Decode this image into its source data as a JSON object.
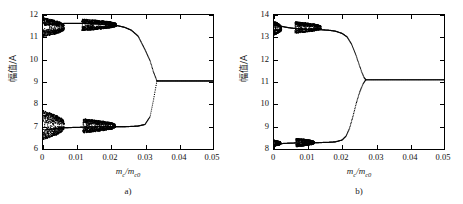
{
  "figure": {
    "panels": [
      {
        "id": "a",
        "caption": "a)",
        "xaxis_label_main": "m",
        "xaxis_label_sub1": "c",
        "xaxis_label_mid": "/m",
        "xaxis_label_sub2": "c0",
        "yaxis_label": "幅值/A",
        "xticks": [
          "0",
          "0.01",
          "0.02",
          "0.03",
          "0.04",
          "0.05"
        ],
        "yticks": [
          "6",
          "7",
          "8",
          "9",
          "10",
          "11",
          "12"
        ]
      },
      {
        "id": "b",
        "caption": "b)",
        "xaxis_label_main": "m",
        "xaxis_label_sub1": "c",
        "xaxis_label_mid": "/m",
        "xaxis_label_sub2": "c0",
        "yaxis_label": "幅值/A",
        "xticks": [
          "0",
          "0.01",
          "0.02",
          "0.03",
          "0.04",
          "0.05"
        ],
        "yticks": [
          "8",
          "9",
          "10",
          "11",
          "12",
          "13",
          "14"
        ]
      }
    ]
  },
  "chart_data": [
    {
      "type": "scatter",
      "panel": "a",
      "title": "",
      "xlabel": "m_c/m_c0",
      "ylabel": "幅值/A",
      "xlim": [
        0,
        0.05
      ],
      "ylim": [
        6,
        12
      ],
      "xticks": [
        0,
        0.01,
        0.02,
        0.03,
        0.04,
        0.05
      ],
      "yticks": [
        6,
        7,
        8,
        9,
        10,
        11,
        12
      ],
      "grid": false,
      "legend": "none",
      "description": "Bifurcation diagram: chaotic/period-doubled bands at low m_c/m_c0 collapsing to a single branch near m_c/m_c0 = 0.033 at amplitude 9.05",
      "branches": [
        {
          "name": "upper-branch",
          "x": [
            0.0005,
            0.002,
            0.004,
            0.006,
            0.008,
            0.01,
            0.012,
            0.014,
            0.016,
            0.018,
            0.02,
            0.022,
            0.024,
            0.026,
            0.028,
            0.03,
            0.0315,
            0.0325,
            0.0335
          ],
          "y": [
            11.55,
            11.58,
            11.6,
            11.62,
            11.62,
            11.62,
            11.63,
            11.62,
            11.6,
            11.58,
            11.56,
            11.52,
            11.45,
            11.32,
            11.05,
            10.45,
            9.95,
            9.45,
            9.05
          ]
        },
        {
          "name": "lower-branch",
          "x": [
            0.0005,
            0.002,
            0.004,
            0.006,
            0.008,
            0.01,
            0.012,
            0.014,
            0.016,
            0.018,
            0.02,
            0.022,
            0.024,
            0.026,
            0.028,
            0.03,
            0.0315,
            0.0325,
            0.0335
          ],
          "y": [
            6.85,
            6.88,
            6.92,
            6.95,
            6.96,
            6.97,
            6.98,
            6.99,
            7.0,
            7.0,
            7.0,
            7.0,
            7.0,
            7.01,
            7.03,
            7.1,
            7.45,
            8.2,
            9.05
          ]
        },
        {
          "name": "merged-branch",
          "x": [
            0.0335,
            0.036,
            0.04,
            0.044,
            0.048,
            0.05
          ],
          "y": [
            9.05,
            9.05,
            9.05,
            9.05,
            9.05,
            9.05
          ]
        }
      ],
      "chaotic_bands": [
        {
          "name": "upper-band-1",
          "x_range": [
            0.0,
            0.0062
          ],
          "y_range": [
            11.02,
            11.88
          ]
        },
        {
          "name": "upper-band-2",
          "x_range": [
            0.0115,
            0.0215
          ],
          "y_range": [
            11.3,
            11.82
          ]
        },
        {
          "name": "lower-band-1",
          "x_range": [
            0.0,
            0.0062
          ],
          "y_range": [
            6.42,
            7.72
          ]
        },
        {
          "name": "lower-band-2",
          "x_range": [
            0.0118,
            0.0212
          ],
          "y_range": [
            6.72,
            7.35
          ]
        }
      ]
    },
    {
      "type": "scatter",
      "panel": "b",
      "title": "",
      "xlabel": "m_c/m_c0",
      "ylabel": "幅值/A",
      "xlim": [
        0,
        0.05
      ],
      "ylim": [
        8,
        14
      ],
      "xticks": [
        0,
        0.01,
        0.02,
        0.03,
        0.04,
        0.05
      ],
      "yticks": [
        8,
        9,
        10,
        11,
        12,
        13,
        14
      ],
      "grid": false,
      "legend": "none",
      "description": "Bifurcation diagram: period-doubled bands at low m_c/m_c0 with a steep near-vertical transition merging to a single branch near m_c/m_c0 = 0.027 at amplitude 11.1",
      "branches": [
        {
          "name": "upper-branch",
          "x": [
            0.0005,
            0.002,
            0.004,
            0.006,
            0.008,
            0.01,
            0.012,
            0.014,
            0.016,
            0.018,
            0.02,
            0.0215,
            0.0228,
            0.024,
            0.025,
            0.0258,
            0.0265,
            0.027
          ],
          "y": [
            13.58,
            13.5,
            13.44,
            13.4,
            13.38,
            13.36,
            13.35,
            13.34,
            13.32,
            13.28,
            13.18,
            13.02,
            12.7,
            12.25,
            11.8,
            11.45,
            11.2,
            11.1
          ]
        },
        {
          "name": "lower-branch",
          "x": [
            0.0005,
            0.002,
            0.004,
            0.006,
            0.008,
            0.01,
            0.012,
            0.014,
            0.016,
            0.018,
            0.02,
            0.0212,
            0.0222,
            0.0232,
            0.0242,
            0.0252,
            0.0262,
            0.027
          ],
          "y": [
            8.22,
            8.24,
            8.26,
            8.27,
            8.28,
            8.28,
            8.28,
            8.29,
            8.3,
            8.32,
            8.4,
            8.58,
            8.92,
            9.45,
            10.05,
            10.55,
            10.92,
            11.1
          ]
        },
        {
          "name": "merged-branch",
          "x": [
            0.027,
            0.03,
            0.035,
            0.04,
            0.045,
            0.05
          ],
          "y": [
            11.1,
            11.1,
            11.1,
            11.1,
            11.1,
            11.1
          ]
        }
      ],
      "chaotic_bands": [
        {
          "name": "upper-band-1",
          "x_range": [
            0.0,
            0.0022
          ],
          "y_range": [
            13.1,
            13.72
          ]
        },
        {
          "name": "upper-band-2",
          "x_range": [
            0.0062,
            0.0138
          ],
          "y_range": [
            13.18,
            13.7
          ]
        },
        {
          "name": "lower-band-1",
          "x_range": [
            0.0,
            0.002
          ],
          "y_range": [
            8.12,
            8.4
          ]
        },
        {
          "name": "lower-band-2",
          "x_range": [
            0.0065,
            0.0118
          ],
          "y_range": [
            8.1,
            8.48
          ]
        }
      ]
    }
  ]
}
